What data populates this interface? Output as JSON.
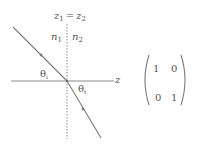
{
  "diagram": {
    "interface_label": "z",
    "interface_label_sub1": "1",
    "equals": "=",
    "interface_label_sub2": "2",
    "medium1": {
      "symbol": "n",
      "sub": "1"
    },
    "medium2": {
      "symbol": "n",
      "sub": "2"
    },
    "axis_label": "z",
    "incident_angle": {
      "symbol": "θ",
      "sub": "i"
    },
    "transmitted_angle": {
      "symbol": "θ",
      "sub": "t"
    },
    "line_color": "#7a7a7a",
    "text_color": "#555555"
  },
  "matrix": {
    "rows": [
      [
        "1",
        "0"
      ],
      [
        "0",
        "1"
      ]
    ]
  }
}
